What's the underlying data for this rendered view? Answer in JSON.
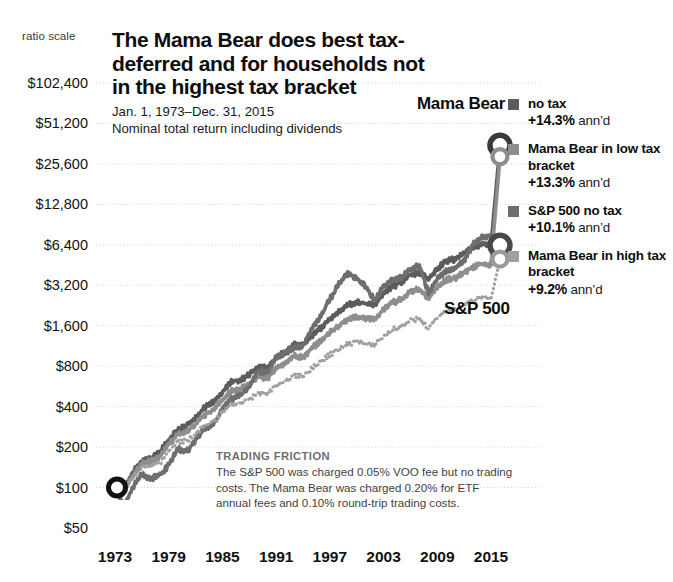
{
  "header": {
    "title": "The Mama Bear does best tax-deferred and for households not in the highest tax bracket",
    "date_range": "Jan. 1, 1973–Dec. 31, 2015",
    "subtitle": "Nominal total return including dividends"
  },
  "axes": {
    "ratio_scale_label": "ratio scale",
    "y_ticks": [
      "$102,400",
      "$51,200",
      "$25,600",
      "$12,800",
      "$6,400",
      "$3,200",
      "$1,600",
      "$800",
      "$400",
      "$200",
      "$100",
      "$50"
    ],
    "x_ticks": [
      "1973",
      "1979",
      "1985",
      "1991",
      "1997",
      "2003",
      "2009",
      "2015"
    ]
  },
  "inline_labels": {
    "mama_bear": "Mama Bear",
    "sp500": "S&P 500"
  },
  "legend": [
    {
      "name": "no tax",
      "perf": "+14.3%",
      "suffix": "ann’d",
      "color": "#5c5c5c"
    },
    {
      "name": "Mama Bear in low tax bracket",
      "perf": "+13.3%",
      "suffix": "ann’d",
      "color": "#8e8e8e"
    },
    {
      "name": "S&P 500 no tax",
      "perf": "+10.1%",
      "suffix": "ann’d",
      "color": "#6e6e6e"
    },
    {
      "name": "Mama Bear in high tax bracket",
      "perf": "+9.2%",
      "suffix": "ann’d",
      "color": "#a0a0a0"
    }
  ],
  "footnote": {
    "heading": "TRADING FRICTION",
    "body": "The S&P 500 was charged 0.05% VOO fee but no trading costs. The Mama Bear was charged 0.20% for ETF annual fees and 0.10% round-trip trading costs."
  },
  "colors": {
    "series_dark": "#5c5c5c",
    "series_mid": "#8e8e8e",
    "series_light": "#a0a0a0",
    "gridline": "#d9d9d9",
    "text": "#111111"
  },
  "chart_data": {
    "type": "line",
    "title": "The Mama Bear does best tax-deferred and for households not in the highest tax bracket",
    "subtitle": "Nominal total return including dividends",
    "xlabel": "",
    "ylabel": "",
    "yscale": "log",
    "ylim": [
      50,
      102400
    ],
    "xlim": [
      1973,
      2016
    ],
    "grid": true,
    "legend_position": "right",
    "ytick_values": [
      102400,
      51200,
      25600,
      12800,
      6400,
      3200,
      1600,
      800,
      400,
      200,
      100,
      50
    ],
    "xtick_values": [
      1973,
      1979,
      1985,
      1991,
      1997,
      2003,
      2009,
      2015
    ],
    "annotations": [
      "Jan. 1, 1973–Dec. 31, 2015",
      "ratio scale",
      "Mama Bear",
      "S&P 500",
      "TRADING FRICTION: The S&P 500 was charged 0.05% VOO fee but no trading costs. The Mama Bear was charged 0.20% for ETF annual fees and 0.10% round-trip trading costs."
    ],
    "x": [
      1973,
      1974,
      1975,
      1976,
      1977,
      1978,
      1979,
      1980,
      1981,
      1982,
      1983,
      1984,
      1985,
      1986,
      1987,
      1988,
      1989,
      1990,
      1991,
      1992,
      1993,
      1994,
      1995,
      1996,
      1997,
      1998,
      1999,
      2000,
      2001,
      2002,
      2003,
      2004,
      2005,
      2006,
      2007,
      2008,
      2009,
      2010,
      2011,
      2012,
      2013,
      2014,
      2015
    ],
    "series": [
      {
        "name": "Mama Bear, no tax",
        "annualized_return_pct": 14.3,
        "style": "solid",
        "color": "#5c5c5c",
        "values": [
          100,
          96,
          130,
          158,
          166,
          183,
          226,
          274,
          286,
          330,
          392,
          430,
          520,
          610,
          630,
          690,
          790,
          780,
          930,
          1010,
          1160,
          1140,
          1360,
          1540,
          1800,
          2030,
          2260,
          2390,
          2340,
          2300,
          2780,
          3140,
          3380,
          3830,
          4030,
          3500,
          4230,
          4830,
          5000,
          5520,
          6100,
          6500,
          6400
        ],
        "end_value": 35000
      },
      {
        "name": "Mama Bear in low tax bracket",
        "annualized_return_pct": 13.3,
        "style": "solid",
        "color": "#8e8e8e",
        "values": [
          100,
          94,
          124,
          150,
          156,
          170,
          208,
          250,
          258,
          296,
          348,
          378,
          452,
          526,
          540,
          586,
          666,
          652,
          772,
          832,
          948,
          926,
          1096,
          1232,
          1428,
          1598,
          1766,
          1854,
          1806,
          1764,
          2116,
          2374,
          2538,
          2856,
          2986,
          2580,
          3100,
          3520,
          3622,
          3974,
          4366,
          4628,
          4530
        ],
        "end_value": 29000
      },
      {
        "name": "S&P 500, no tax",
        "annualized_return_pct": 10.1,
        "style": "solid",
        "color": "#6e6e6e",
        "values": [
          100,
          73,
          101,
          125,
          116,
          124,
          147,
          195,
          185,
          225,
          276,
          293,
          386,
          458,
          482,
          562,
          740,
          717,
          935,
          1006,
          1107,
          1122,
          1543,
          1897,
          2530,
          3253,
          3937,
          3578,
          3153,
          2456,
          3161,
          3505,
          3677,
          4258,
          4493,
          2831,
          3582,
          4122,
          4209,
          4881,
          6462,
          7344,
          7446
        ],
        "end_value": 6400
      },
      {
        "name": "Mama Bear in high tax bracket",
        "annualized_return_pct": 9.2,
        "style": "dotted",
        "color": "#a0a0a0",
        "values": [
          100,
          92,
          118,
          140,
          144,
          154,
          184,
          218,
          222,
          250,
          290,
          310,
          364,
          416,
          424,
          456,
          510,
          496,
          578,
          614,
          688,
          666,
          774,
          856,
          978,
          1080,
          1178,
          1222,
          1176,
          1134,
          1346,
          1492,
          1578,
          1754,
          1812,
          1548,
          1840,
          2068,
          2104,
          2286,
          2488,
          2614,
          2540
        ],
        "end_value": 5000
      }
    ]
  }
}
